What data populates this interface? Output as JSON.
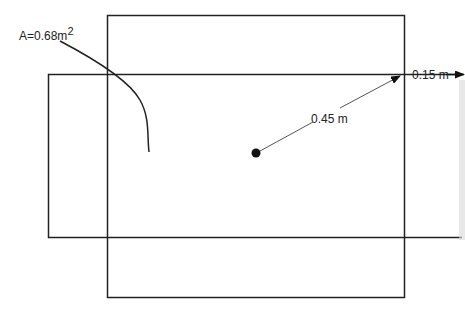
{
  "diagram": {
    "area_label": "A=0.68m",
    "area_superscript": "2",
    "radius_label": "0.45 m",
    "offset_label": "0.15 m",
    "stroke_color": "#222222"
  }
}
